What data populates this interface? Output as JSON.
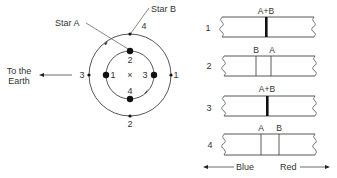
{
  "orbit_diagram": {
    "star_a_label": "Star A",
    "star_b_label": "Star B",
    "earth_label_line1": "To the",
    "earth_label_line2": "Earth",
    "center_marker": "×",
    "inner_orbit_positions": {
      "top": "2",
      "left": "1",
      "right": "3",
      "bottom": "4"
    },
    "outer_orbit_positions": {
      "top": "4",
      "left": "3",
      "right": "1",
      "bottom": "2"
    }
  },
  "spectra": {
    "panels": [
      {
        "number": "1",
        "lines": [
          {
            "label": "A+B",
            "position": 0.47,
            "merged": true
          }
        ]
      },
      {
        "number": "2",
        "lines": [
          {
            "label": "B",
            "position": 0.36,
            "merged": false
          },
          {
            "label": "A",
            "position": 0.52,
            "merged": false
          }
        ]
      },
      {
        "number": "3",
        "lines": [
          {
            "label": "A+B",
            "position": 0.47,
            "merged": true
          }
        ]
      },
      {
        "number": "4",
        "lines": [
          {
            "label": "A",
            "position": 0.4,
            "merged": false
          },
          {
            "label": "B",
            "position": 0.6,
            "merged": false
          }
        ]
      }
    ],
    "axis": {
      "left_label": "Blue",
      "right_label": "Red"
    }
  }
}
